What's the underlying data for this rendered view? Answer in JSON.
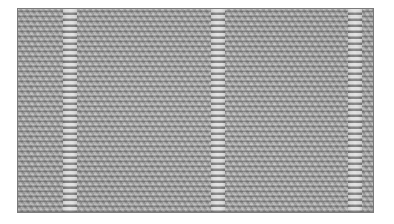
{
  "image": {
    "subject": "knitted fabric texture",
    "description": "Gray knitted fabric with garter/seed stitch panels separated by vertical twisted rib columns",
    "colors": {
      "base": "#a9a9a9",
      "highlight": "#e0e0e0",
      "shadow": "#5a5a5a",
      "border": "#7a7a7a",
      "background": "#ffffff"
    },
    "rib_columns_x": [
      52,
      200,
      344
    ]
  }
}
